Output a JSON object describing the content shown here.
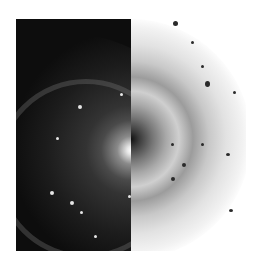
{
  "image": {
    "description": "Spiral galaxy shown split vertically: left half normal (bright core on black), right half inverted (dark core on white)",
    "left_half": {
      "style": "positive",
      "background": "#0d0d0d"
    },
    "right_half": {
      "style": "negative",
      "background": "#ffffff"
    }
  }
}
